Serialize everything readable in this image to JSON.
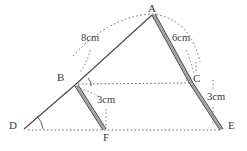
{
  "figure": {
    "colors": {
      "stroke": "#4a4a4a",
      "dotted": "#6b6b6b",
      "thick_fill": "#8a8a8a",
      "text": "#3a3a3a",
      "background": "#ffffff"
    },
    "vertex_labels": [
      {
        "name": "A",
        "text": "A",
        "x": 148,
        "y": 3
      },
      {
        "name": "B",
        "text": "B",
        "x": 57,
        "y": 72
      },
      {
        "name": "C",
        "text": "C",
        "x": 193,
        "y": 73
      },
      {
        "name": "D",
        "text": "D",
        "x": 9,
        "y": 120
      },
      {
        "name": "E",
        "text": "E",
        "x": 228,
        "y": 120
      },
      {
        "name": "F",
        "text": "F",
        "x": 103,
        "y": 132
      }
    ],
    "measure_labels": [
      {
        "name": "ab-length",
        "text": "8cm",
        "x": 81,
        "y": 33
      },
      {
        "name": "ac-length",
        "text": "6cm",
        "x": 172,
        "y": 33
      },
      {
        "name": "bf-length",
        "text": "3cm",
        "x": 97,
        "y": 95
      },
      {
        "name": "ce-length",
        "text": "3cm",
        "x": 207,
        "y": 92
      }
    ],
    "points": {
      "A": {
        "x": 152,
        "y": 14
      },
      "B": {
        "x": 75,
        "y": 85
      },
      "C": {
        "x": 190,
        "y": 84
      },
      "D": {
        "x": 24,
        "y": 129
      },
      "E": {
        "x": 222,
        "y": 129
      },
      "F": {
        "x": 105,
        "y": 129
      }
    },
    "segments": [
      {
        "name": "segment-a-b",
        "from": "A",
        "to": "B",
        "style": "solid"
      },
      {
        "name": "segment-a-c",
        "from": "A",
        "to": "C",
        "style": "thick"
      },
      {
        "name": "segment-c-e",
        "from": "C",
        "to": "E",
        "style": "thick"
      },
      {
        "name": "segment-b-f",
        "from": "B",
        "to": "F",
        "style": "thick"
      },
      {
        "name": "segment-b-d",
        "from": "B",
        "to": "D",
        "style": "solid"
      },
      {
        "name": "segment-b-c",
        "from": "B",
        "to": "C",
        "style": "dotted"
      },
      {
        "name": "segment-d-e",
        "from": "D",
        "to": "E",
        "style": "dotted"
      }
    ],
    "arcs": [
      {
        "name": "arc-over-apex",
        "description": "dotted arc from B over A to C"
      },
      {
        "name": "angle-arc-b",
        "description": "angle mark at B"
      },
      {
        "name": "angle-arc-d",
        "description": "angle mark at D"
      },
      {
        "name": "angle-arc-c",
        "description": "angle mark at C"
      }
    ]
  }
}
